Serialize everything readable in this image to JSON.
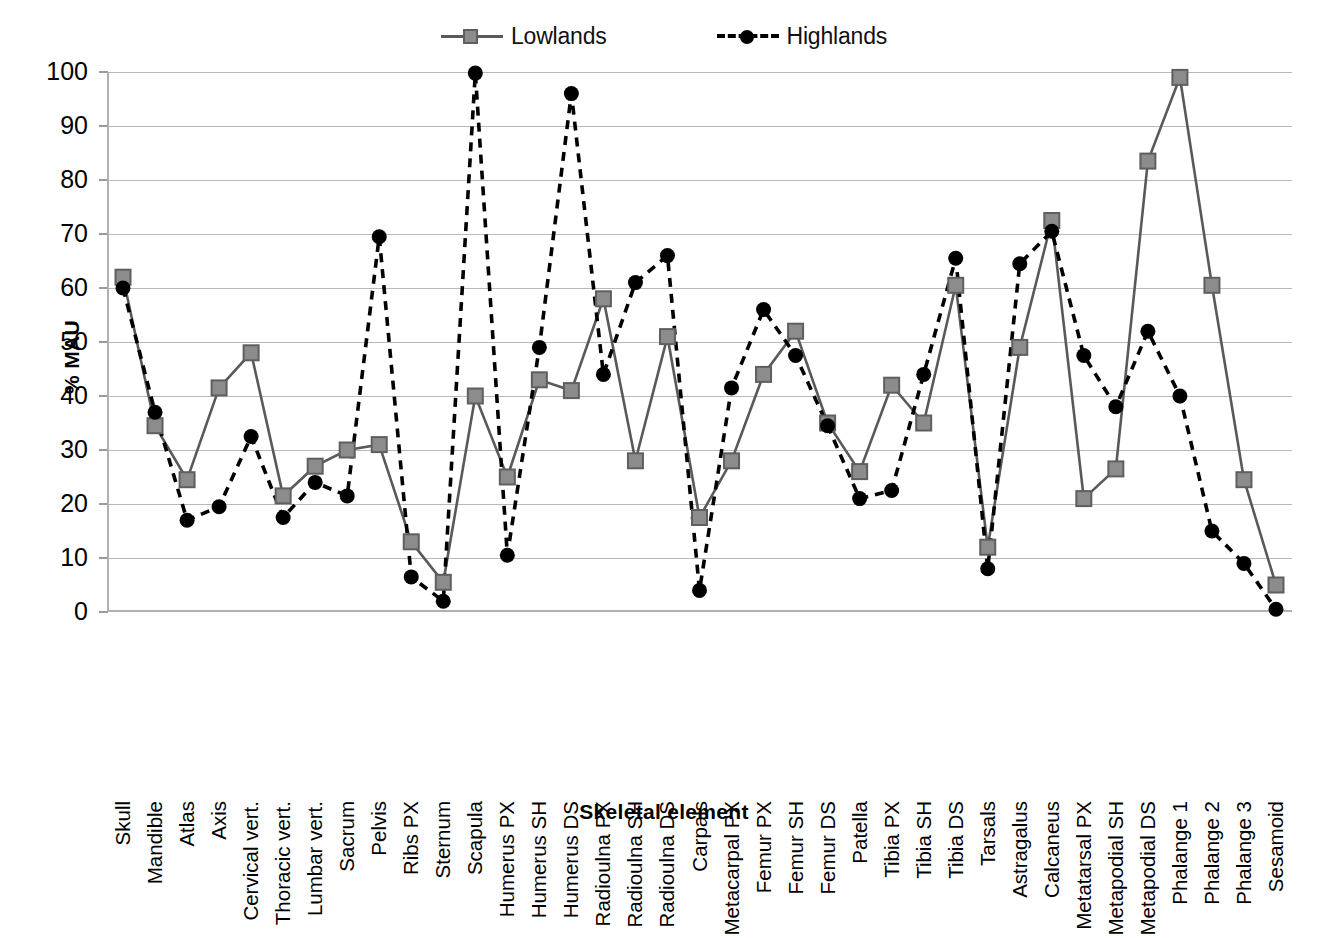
{
  "chart_data": {
    "type": "line",
    "title": "",
    "xlabel": "Skeletal element",
    "ylabel": "% MAU",
    "ylim": [
      0,
      100
    ],
    "ytick_step": 10,
    "yticks": [
      100,
      90,
      80,
      70,
      60,
      50,
      40,
      30,
      20,
      10,
      0
    ],
    "grid": true,
    "legend_position": "top-center",
    "categories": [
      "Skull",
      "Mandible",
      "Atlas",
      "Axis",
      "Cervical vert.",
      "Thoracic vert.",
      "Lumbar vert.",
      "Sacrum",
      "Pelvis",
      "Ribs PX",
      "Sternum",
      "Scapula",
      "Humerus PX",
      "Humerus SH",
      "Humerus DS",
      "Radioulna PX",
      "Radioulna SH",
      "Radioulna DS",
      "Carpals",
      "Metacarpal PX",
      "Femur PX",
      "Femur SH",
      "Femur DS",
      "Patella",
      "Tibia PX",
      "Tibia SH",
      "Tibia DS",
      "Tarsals",
      "Astragalus",
      "Calcaneus",
      "Metatarsal PX",
      "Metapodial SH",
      "Metapodial DS",
      "Phalange 1",
      "Phalange 2",
      "Phalange 3",
      "Sesamoid"
    ],
    "series": [
      {
        "name": "Lowlands",
        "marker": "square",
        "linestyle": "solid",
        "color": "#8c8c8c",
        "line_color": "#595959",
        "values": [
          62,
          34.5,
          24.5,
          41.5,
          48,
          21.5,
          27,
          30,
          31,
          13,
          5.5,
          40,
          25,
          43,
          41,
          58,
          28,
          51,
          17.5,
          28,
          44,
          52,
          35,
          26,
          42,
          35,
          60.5,
          12,
          49,
          72.5,
          21,
          26.5,
          83.5,
          99,
          60.5,
          24.5,
          5
        ]
      },
      {
        "name": "Highlands",
        "marker": "circle",
        "linestyle": "dashed",
        "color": "#000000",
        "line_color": "#000000",
        "values": [
          60,
          37,
          17,
          19.5,
          32.5,
          17.5,
          24,
          21.5,
          69.5,
          6.5,
          2,
          99.8,
          10.5,
          49,
          96,
          44,
          61,
          66,
          4,
          41.5,
          56,
          47.5,
          34.5,
          21,
          22.5,
          44,
          65.5,
          8,
          64.5,
          70.5,
          47.5,
          38,
          52,
          40,
          15,
          9,
          0.5
        ]
      }
    ]
  },
  "legend": {
    "entries": [
      {
        "label": "Lowlands"
      },
      {
        "label": "Highlands"
      }
    ]
  },
  "axes": {
    "y_title": "% MAU",
    "x_title": "Skeletal element"
  },
  "colors": {
    "lowlands_marker": "#8c8c8c",
    "lowlands_line": "#595959",
    "highlands": "#000000",
    "gridline": "#b9b9b9",
    "axis": "#b0b0b0"
  }
}
